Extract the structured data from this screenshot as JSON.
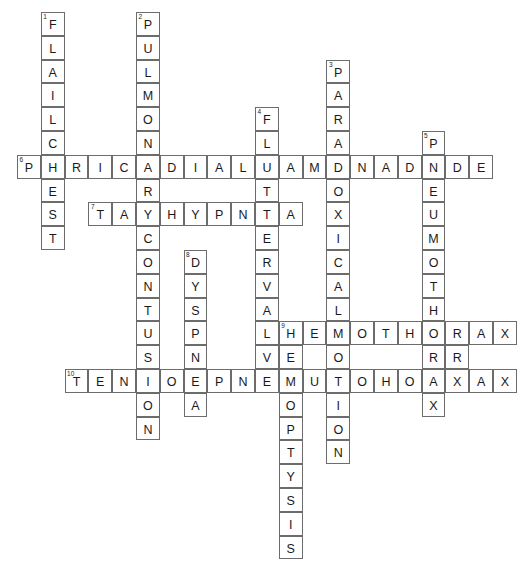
{
  "puzzle": {
    "title": "Chest Trauma Crossword",
    "grid": {
      "cell_size": 23.8,
      "origin_x": 17,
      "origin_y": 12,
      "cols": 21,
      "rows": 23
    },
    "entries": [
      {
        "number": "1",
        "direction": "down",
        "answer": "FLAILCHEST",
        "col": 1,
        "row": 0
      },
      {
        "number": "2",
        "direction": "down",
        "answer": "PULMONARYCONTUSION",
        "col": 5,
        "row": 0
      },
      {
        "number": "3",
        "direction": "down",
        "answer": "PARADOXICALMOTION",
        "col": 13,
        "row": 2
      },
      {
        "number": "4",
        "direction": "down",
        "answer": "FLUTTERVALVE",
        "col": 10,
        "row": 4
      },
      {
        "number": "5",
        "direction": "down",
        "answer": "PNEUMOTHORAX",
        "col": 17,
        "row": 5
      },
      {
        "number": "6",
        "direction": "across",
        "answer": "PERICARDIALTAMPONADE",
        "col": 0,
        "row": 6
      },
      {
        "number": "7",
        "direction": "across",
        "answer": "TACHYPNEA",
        "col": 3,
        "row": 8
      },
      {
        "number": "8",
        "direction": "down",
        "answer": "DYSPNEA",
        "col": 7,
        "row": 10
      },
      {
        "number": "9",
        "direction": "across",
        "answer": "HEMOTHORAX",
        "col": 11,
        "row": 13
      },
      {
        "number": "9",
        "direction": "down",
        "answer": "HEMOPTYSIS",
        "col": 11,
        "row": 13
      },
      {
        "number": "10",
        "direction": "across",
        "answer": "TENSIONPNEUMOTHORAX",
        "col": 2,
        "row": 15
      }
    ],
    "cells": [
      {
        "col": 1,
        "row": 0,
        "letter": "F",
        "num": "1"
      },
      {
        "col": 1,
        "row": 1,
        "letter": "L",
        "num": ""
      },
      {
        "col": 1,
        "row": 2,
        "letter": "A",
        "num": ""
      },
      {
        "col": 1,
        "row": 3,
        "letter": "I",
        "num": ""
      },
      {
        "col": 1,
        "row": 4,
        "letter": "L",
        "num": ""
      },
      {
        "col": 1,
        "row": 5,
        "letter": "C",
        "num": ""
      },
      {
        "col": 1,
        "row": 6,
        "letter": "H",
        "num": ""
      },
      {
        "col": 1,
        "row": 7,
        "letter": "E",
        "num": ""
      },
      {
        "col": 1,
        "row": 8,
        "letter": "S",
        "num": ""
      },
      {
        "col": 1,
        "row": 9,
        "letter": "T",
        "num": ""
      },
      {
        "col": 5,
        "row": 0,
        "letter": "P",
        "num": "2"
      },
      {
        "col": 5,
        "row": 1,
        "letter": "U",
        "num": ""
      },
      {
        "col": 5,
        "row": 2,
        "letter": "L",
        "num": ""
      },
      {
        "col": 5,
        "row": 3,
        "letter": "M",
        "num": ""
      },
      {
        "col": 5,
        "row": 4,
        "letter": "O",
        "num": ""
      },
      {
        "col": 5,
        "row": 5,
        "letter": "N",
        "num": ""
      },
      {
        "col": 5,
        "row": 6,
        "letter": "A",
        "num": ""
      },
      {
        "col": 5,
        "row": 7,
        "letter": "R",
        "num": ""
      },
      {
        "col": 5,
        "row": 8,
        "letter": "Y",
        "num": ""
      },
      {
        "col": 5,
        "row": 9,
        "letter": "C",
        "num": ""
      },
      {
        "col": 5,
        "row": 10,
        "letter": "O",
        "num": ""
      },
      {
        "col": 5,
        "row": 11,
        "letter": "N",
        "num": ""
      },
      {
        "col": 5,
        "row": 12,
        "letter": "T",
        "num": ""
      },
      {
        "col": 5,
        "row": 13,
        "letter": "U",
        "num": ""
      },
      {
        "col": 5,
        "row": 14,
        "letter": "S",
        "num": ""
      },
      {
        "col": 5,
        "row": 15,
        "letter": "I",
        "num": ""
      },
      {
        "col": 5,
        "row": 16,
        "letter": "O",
        "num": ""
      },
      {
        "col": 5,
        "row": 17,
        "letter": "N",
        "num": ""
      },
      {
        "col": 13,
        "row": 2,
        "letter": "P",
        "num": "3"
      },
      {
        "col": 13,
        "row": 3,
        "letter": "A",
        "num": ""
      },
      {
        "col": 13,
        "row": 4,
        "letter": "R",
        "num": ""
      },
      {
        "col": 13,
        "row": 5,
        "letter": "A",
        "num": ""
      },
      {
        "col": 13,
        "row": 6,
        "letter": "D",
        "num": ""
      },
      {
        "col": 13,
        "row": 7,
        "letter": "O",
        "num": ""
      },
      {
        "col": 13,
        "row": 8,
        "letter": "X",
        "num": ""
      },
      {
        "col": 13,
        "row": 9,
        "letter": "I",
        "num": ""
      },
      {
        "col": 13,
        "row": 10,
        "letter": "C",
        "num": ""
      },
      {
        "col": 13,
        "row": 11,
        "letter": "A",
        "num": ""
      },
      {
        "col": 13,
        "row": 12,
        "letter": "L",
        "num": ""
      },
      {
        "col": 13,
        "row": 13,
        "letter": "M",
        "num": ""
      },
      {
        "col": 13,
        "row": 14,
        "letter": "O",
        "num": ""
      },
      {
        "col": 13,
        "row": 15,
        "letter": "T",
        "num": ""
      },
      {
        "col": 13,
        "row": 16,
        "letter": "I",
        "num": ""
      },
      {
        "col": 13,
        "row": 17,
        "letter": "O",
        "num": ""
      },
      {
        "col": 13,
        "row": 18,
        "letter": "N",
        "num": ""
      },
      {
        "col": 10,
        "row": 4,
        "letter": "F",
        "num": "4"
      },
      {
        "col": 10,
        "row": 5,
        "letter": "L",
        "num": ""
      },
      {
        "col": 10,
        "row": 6,
        "letter": "U",
        "num": ""
      },
      {
        "col": 10,
        "row": 7,
        "letter": "T",
        "num": ""
      },
      {
        "col": 10,
        "row": 8,
        "letter": "T",
        "num": ""
      },
      {
        "col": 10,
        "row": 9,
        "letter": "E",
        "num": ""
      },
      {
        "col": 10,
        "row": 10,
        "letter": "R",
        "num": ""
      },
      {
        "col": 10,
        "row": 11,
        "letter": "V",
        "num": ""
      },
      {
        "col": 10,
        "row": 12,
        "letter": "A",
        "num": ""
      },
      {
        "col": 10,
        "row": 13,
        "letter": "L",
        "num": ""
      },
      {
        "col": 10,
        "row": 14,
        "letter": "V",
        "num": ""
      },
      {
        "col": 10,
        "row": 15,
        "letter": "E",
        "num": ""
      },
      {
        "col": 17,
        "row": 5,
        "letter": "P",
        "num": "5"
      },
      {
        "col": 17,
        "row": 6,
        "letter": "N",
        "num": ""
      },
      {
        "col": 17,
        "row": 7,
        "letter": "E",
        "num": ""
      },
      {
        "col": 17,
        "row": 8,
        "letter": "U",
        "num": ""
      },
      {
        "col": 17,
        "row": 9,
        "letter": "M",
        "num": ""
      },
      {
        "col": 17,
        "row": 10,
        "letter": "O",
        "num": ""
      },
      {
        "col": 17,
        "row": 11,
        "letter": "T",
        "num": ""
      },
      {
        "col": 17,
        "row": 12,
        "letter": "H",
        "num": ""
      },
      {
        "col": 17,
        "row": 13,
        "letter": "O",
        "num": ""
      },
      {
        "col": 17,
        "row": 14,
        "letter": "R",
        "num": ""
      },
      {
        "col": 17,
        "row": 15,
        "letter": "A",
        "num": ""
      },
      {
        "col": 17,
        "row": 16,
        "letter": "X",
        "num": ""
      },
      {
        "col": 0,
        "row": 6,
        "letter": "P",
        "num": "6"
      },
      {
        "col": 2,
        "row": 6,
        "letter": "R",
        "num": ""
      },
      {
        "col": 3,
        "row": 6,
        "letter": "I",
        "num": ""
      },
      {
        "col": 4,
        "row": 6,
        "letter": "C",
        "num": ""
      },
      {
        "col": 6,
        "row": 6,
        "letter": "D",
        "num": ""
      },
      {
        "col": 7,
        "row": 6,
        "letter": "I",
        "num": ""
      },
      {
        "col": 8,
        "row": 6,
        "letter": "A",
        "num": ""
      },
      {
        "col": 9,
        "row": 6,
        "letter": "L",
        "num": ""
      },
      {
        "col": 11,
        "row": 6,
        "letter": "A",
        "num": ""
      },
      {
        "col": 12,
        "row": 6,
        "letter": "M",
        "num": ""
      },
      {
        "col": 14,
        "row": 6,
        "letter": "N",
        "num": ""
      },
      {
        "col": 15,
        "row": 6,
        "letter": "A",
        "num": ""
      },
      {
        "col": 16,
        "row": 6,
        "letter": "D",
        "num": ""
      },
      {
        "col": 3,
        "row": 8,
        "letter": "T",
        "num": "7"
      },
      {
        "col": 4,
        "row": 8,
        "letter": "A",
        "num": ""
      },
      {
        "col": 6,
        "row": 8,
        "letter": "H",
        "num": ""
      },
      {
        "col": 7,
        "row": 8,
        "letter": "Y",
        "num": ""
      },
      {
        "col": 8,
        "row": 8,
        "letter": "P",
        "num": ""
      },
      {
        "col": 9,
        "row": 8,
        "letter": "N",
        "num": ""
      },
      {
        "col": 11,
        "row": 8,
        "letter": "A",
        "num": ""
      },
      {
        "col": 7,
        "row": 10,
        "letter": "D",
        "num": "8"
      },
      {
        "col": 7,
        "row": 11,
        "letter": "Y",
        "num": ""
      },
      {
        "col": 7,
        "row": 12,
        "letter": "S",
        "num": ""
      },
      {
        "col": 7,
        "row": 13,
        "letter": "P",
        "num": ""
      },
      {
        "col": 7,
        "row": 14,
        "letter": "N",
        "num": ""
      },
      {
        "col": 7,
        "row": 15,
        "letter": "E",
        "num": ""
      },
      {
        "col": 7,
        "row": 16,
        "letter": "A",
        "num": ""
      },
      {
        "col": 11,
        "row": 13,
        "letter": "H",
        "num": "9"
      },
      {
        "col": 12,
        "row": 13,
        "letter": "E",
        "num": ""
      },
      {
        "col": 14,
        "row": 13,
        "letter": "O",
        "num": ""
      },
      {
        "col": 15,
        "row": 13,
        "letter": "T",
        "num": ""
      },
      {
        "col": 16,
        "row": 13,
        "letter": "H",
        "num": ""
      },
      {
        "col": 18,
        "row": 13,
        "letter": "R",
        "num": ""
      },
      {
        "col": 19,
        "row": 13,
        "letter": "A",
        "num": ""
      },
      {
        "col": 20,
        "row": 13,
        "letter": "X",
        "num": ""
      },
      {
        "col": 11,
        "row": 14,
        "letter": "E",
        "num": ""
      },
      {
        "col": 11,
        "row": 15,
        "letter": "M",
        "num": ""
      },
      {
        "col": 11,
        "row": 16,
        "letter": "O",
        "num": ""
      },
      {
        "col": 11,
        "row": 17,
        "letter": "P",
        "num": ""
      },
      {
        "col": 11,
        "row": 18,
        "letter": "T",
        "num": ""
      },
      {
        "col": 11,
        "row": 19,
        "letter": "Y",
        "num": ""
      },
      {
        "col": 11,
        "row": 20,
        "letter": "S",
        "num": ""
      },
      {
        "col": 11,
        "row": 21,
        "letter": "I",
        "num": ""
      },
      {
        "col": 11,
        "row": 22,
        "letter": "S",
        "num": ""
      },
      {
        "col": 2,
        "row": 15,
        "letter": "T",
        "num": "10"
      },
      {
        "col": 3,
        "row": 15,
        "letter": "E",
        "num": ""
      },
      {
        "col": 4,
        "row": 15,
        "letter": "N",
        "num": ""
      },
      {
        "col": 6,
        "row": 15,
        "letter": "O",
        "num": ""
      },
      {
        "col": 8,
        "row": 15,
        "letter": "P",
        "num": ""
      },
      {
        "col": 9,
        "row": 15,
        "letter": "N",
        "num": ""
      },
      {
        "col": 12,
        "row": 15,
        "letter": "U",
        "num": ""
      },
      {
        "col": 14,
        "row": 15,
        "letter": "O",
        "num": ""
      },
      {
        "col": 15,
        "row": 15,
        "letter": "H",
        "num": ""
      },
      {
        "col": 16,
        "row": 15,
        "letter": "O",
        "num": ""
      },
      {
        "col": 18,
        "row": 15,
        "letter": "X",
        "num": ""
      },
      {
        "col": 5,
        "row": 15,
        "letter": "I",
        "num": ""
      },
      {
        "col": 10,
        "row": 15,
        "letter": "E",
        "num": ""
      },
      {
        "col": 13,
        "row": 15,
        "letter": "T",
        "num": ""
      },
      {
        "col": 17,
        "row": 15,
        "letter": "A",
        "num": ""
      },
      {
        "col": 18,
        "row": 14,
        "letter": "R",
        "num": ""
      }
    ]
  }
}
